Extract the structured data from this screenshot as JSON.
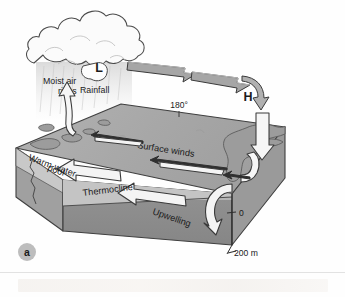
{
  "figure": {
    "panel_label": "a",
    "caption_hidden": true
  },
  "atmosphere": {
    "low_pressure_label": "L",
    "high_pressure_label": "H",
    "moist_air_label_line1": "Moist air",
    "moist_air_label_line2": "rises",
    "rainfall_label": "Rainfall",
    "longitude_label": "180°"
  },
  "ocean": {
    "surface_winds_label": "Surface winds",
    "warm_pool_label_line1": "Warm-water",
    "warm_pool_label_line2": "pool",
    "thermocline_label": "Thermocline",
    "upwelling_label": "Upwelling"
  },
  "depth_scale": {
    "top_tick": "0",
    "bottom_tick": "200 m"
  },
  "colors": {
    "ocean_surface": "#a9a9a9",
    "deep_water_front": "#8d8d8d",
    "deep_water_side": "#9a9a9a",
    "thermocline_band": "#c2c2c2",
    "warm_layer": "#bdbdbd",
    "land": "#9d9d9d",
    "arrow_gray_fill": "#a6a6a6",
    "arrow_white_fill": "#f4f4f4",
    "outline": "#3a3a3a",
    "cloud_fill": "#fbfbfb",
    "text": "#1b1b1b",
    "panel_badge_bg": "#bdbdbd"
  }
}
